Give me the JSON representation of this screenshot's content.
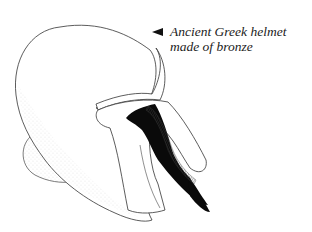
{
  "caption": {
    "line1": "Ancient Greek helmet",
    "line2": "made of bronze"
  },
  "icons": {
    "pointer": "left-arrow-pointer-icon"
  },
  "colors": {
    "line": "#333333",
    "fill_dark": "#0a0a0a",
    "background": "#ffffff"
  }
}
